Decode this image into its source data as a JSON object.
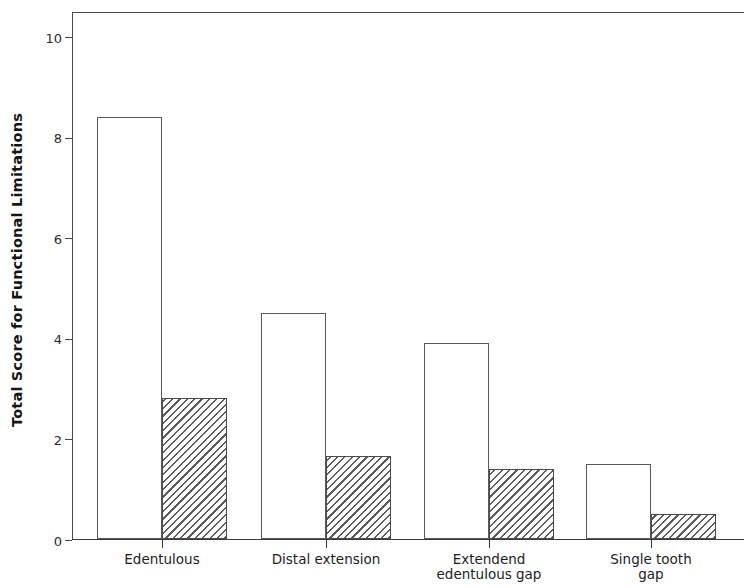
{
  "chart_data": {
    "type": "bar",
    "title": "",
    "subtitle": "",
    "xlabel": "",
    "ylabel": "Total Score for Functional Limitations",
    "categories": [
      "Edentulous",
      "Distal extension",
      "Extendend\nedentulous gap",
      "Single tooth gap"
    ],
    "series": [
      {
        "name": "open",
        "style": "white-outlined",
        "values": [
          8.4,
          4.5,
          3.9,
          1.5
        ]
      },
      {
        "name": "hatched",
        "style": "diagonal-hatch",
        "values": [
          2.8,
          1.65,
          1.4,
          0.5
        ]
      }
    ],
    "ylim": [
      0,
      10.5
    ],
    "yticks": [
      0,
      2,
      4,
      6,
      8,
      10
    ],
    "ytick_labels": [
      "0",
      "2",
      "4",
      "6",
      "8",
      "10"
    ],
    "grid": false,
    "legend": "none",
    "colors": {
      "axis": "#4a4a4a",
      "bar_edge": "#5a5a5a",
      "hatch": "#5d5d5d",
      "bar_fill": "#ffffff",
      "text": "#1a1a1a",
      "background": "#ffffff"
    }
  }
}
